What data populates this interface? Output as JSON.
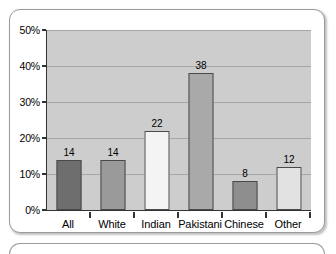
{
  "chart_data": {
    "type": "bar",
    "title": "",
    "subtitle": "",
    "xlabel": "",
    "ylabel": "",
    "categories": [
      "All",
      "White",
      "Indian",
      "Pakistani",
      "Chinese",
      "Other"
    ],
    "values": [
      14,
      14,
      22,
      38,
      8,
      12
    ],
    "data_labels": [
      "14",
      "14",
      "22",
      "38",
      "8",
      "12"
    ],
    "bar_colors": [
      "#6e6e6e",
      "#9a9a9a",
      "#f4f4f4",
      "#a9a9a9",
      "#8e8e8e",
      "#e2e2e2"
    ],
    "bar_border_color": "#4a4a4a",
    "ylim": [
      0,
      50
    ],
    "ytick_values": [
      0,
      10,
      20,
      30,
      40,
      50
    ],
    "ytick_labels": [
      "0%",
      "10%",
      "20%",
      "30%",
      "40%",
      "50%"
    ],
    "grid": true,
    "grid_color": "#a6a6a6",
    "legend": false,
    "legend_position": "none",
    "plot_background": "#cdcdcd",
    "axis_color": "#333333"
  },
  "frame": {
    "border_color": "#9b9b9b",
    "background": "#ffffff"
  }
}
